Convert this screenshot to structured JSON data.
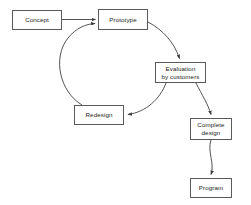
{
  "diagram": {
    "type": "flowchart",
    "background_color": "#ffffff",
    "box_border_color": "#5a5a5a",
    "connector_color": "#3f3f3f",
    "text_color": "#1a1a1a",
    "nodes": [
      {
        "id": "concept",
        "label": "Concept",
        "x": 12,
        "y": 10,
        "w": 50,
        "h": 20
      },
      {
        "id": "prototype",
        "label": "Prototype",
        "x": 98,
        "y": 9,
        "w": 50,
        "h": 21
      },
      {
        "id": "evaluation",
        "label": "Evaluation\nby customers",
        "x": 155,
        "y": 62,
        "w": 51,
        "h": 21
      },
      {
        "id": "redesign",
        "label": "Redesign",
        "x": 74,
        "y": 105,
        "w": 50,
        "h": 20
      },
      {
        "id": "complete",
        "label": "Complete\ndesign",
        "x": 190,
        "y": 118,
        "w": 42,
        "h": 22
      },
      {
        "id": "program",
        "label": "Program",
        "x": 190,
        "y": 178,
        "w": 42,
        "h": 20
      }
    ],
    "edges": [
      {
        "id": "concept-to-prototype",
        "from": "concept",
        "to": "prototype",
        "style": "straight",
        "arrow": true
      },
      {
        "id": "prototype-to-evaluation",
        "from": "prototype",
        "to": "evaluation",
        "style": "curved",
        "arrow": true
      },
      {
        "id": "evaluation-to-redesign",
        "from": "evaluation",
        "to": "redesign",
        "style": "curved",
        "arrow": true
      },
      {
        "id": "redesign-to-prototype",
        "from": "redesign",
        "to": "prototype",
        "style": "curved",
        "arrow": true
      },
      {
        "id": "evaluation-to-complete",
        "from": "evaluation",
        "to": "complete",
        "style": "curved",
        "arrow": true
      },
      {
        "id": "complete-to-program",
        "from": "complete",
        "to": "program",
        "style": "curved",
        "arrow": true
      }
    ]
  }
}
